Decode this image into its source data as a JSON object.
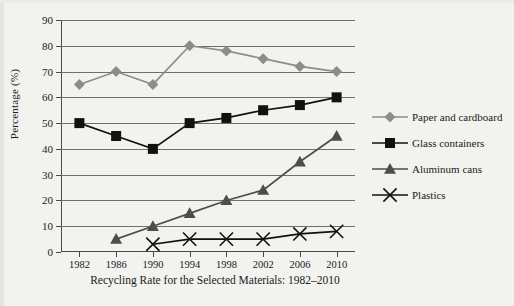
{
  "figure": {
    "caption": "Recycling Rate for the Selected Materials: 1982–2010",
    "y_axis_title": "Percentage (%)"
  },
  "colors": {
    "background": "#f2f2ef",
    "paper_series": "#8c8c8c",
    "glass_series": "#111111",
    "aluminum_series": "#4d4d4d",
    "plastics_series": "#111111",
    "gridline": "#6f6f6f",
    "axis": "#4a4a4a",
    "text": "#1a1a1a"
  },
  "chart_data": {
    "type": "line",
    "title": "Recycling Rate for the Selected Materials: 1982–2010",
    "xlabel": "",
    "ylabel": "Percentage (%)",
    "caption": "Recycling Rate for the Selected Materials: 1982–2010",
    "x": [
      1982,
      1986,
      1990,
      1994,
      1998,
      2002,
      2006,
      2010
    ],
    "categories": [
      "1982",
      "1986",
      "1990",
      "1994",
      "1998",
      "2002",
      "2006",
      "2010"
    ],
    "xlim": [
      1980,
      2012
    ],
    "ylim": [
      0,
      90
    ],
    "ytick_labels": [
      "0",
      "10",
      "20",
      "30",
      "40",
      "50",
      "60",
      "70",
      "80",
      "90"
    ],
    "yticks": [
      0,
      10,
      20,
      30,
      40,
      50,
      60,
      70,
      80,
      90
    ],
    "grid": true,
    "grid_axis": "y",
    "legend_position": "right",
    "series": [
      {
        "name": "Paper and cardboard",
        "marker": "diamond",
        "color": "#8c8c8c",
        "x": [
          1982,
          1986,
          1990,
          1994,
          1998,
          2002,
          2006,
          2010
        ],
        "values": [
          65,
          70,
          65,
          80,
          78,
          75,
          72,
          70
        ]
      },
      {
        "name": "Glass containers",
        "marker": "square",
        "color": "#111111",
        "x": [
          1982,
          1986,
          1990,
          1994,
          1998,
          2002,
          2006,
          2010
        ],
        "values": [
          50,
          45,
          40,
          50,
          52,
          55,
          57,
          60
        ]
      },
      {
        "name": "Aluminum cans",
        "marker": "triangle",
        "color": "#4d4d4d",
        "x": [
          1986,
          1990,
          1994,
          1998,
          2002,
          2006,
          2010
        ],
        "values": [
          5,
          10,
          15,
          20,
          24,
          35,
          45
        ]
      },
      {
        "name": "Plastics",
        "marker": "cross",
        "color": "#111111",
        "x": [
          1990,
          1994,
          1998,
          2002,
          2006,
          2010
        ],
        "values": [
          3,
          5,
          5,
          5,
          7,
          8
        ]
      }
    ]
  },
  "legend": {
    "items": [
      {
        "label": "Paper and cardboard",
        "marker": "diamond",
        "color": "#8c8c8c"
      },
      {
        "label": "Glass containers",
        "marker": "square",
        "color": "#111111"
      },
      {
        "label": "Aluminum cans",
        "marker": "triangle",
        "color": "#4d4d4d"
      },
      {
        "label": "Plastics",
        "marker": "cross",
        "color": "#111111"
      }
    ]
  }
}
